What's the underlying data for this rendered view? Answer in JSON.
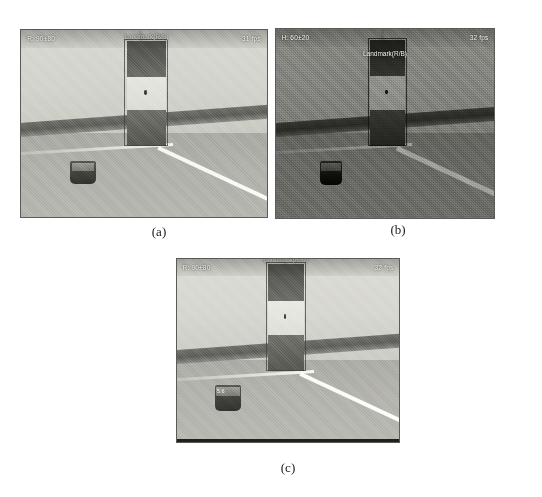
{
  "figure": {
    "panels": [
      {
        "id": "a",
        "caption": "(a)",
        "hud_left": "R: 90±80",
        "hud_right": "31 fps",
        "landmark_label": "Landmark(R/B)",
        "robot_tag": "",
        "style_note": "bright-grayscale"
      },
      {
        "id": "b",
        "caption": "(b)",
        "hud_left": "H: 60±20",
        "hud_right": "32 fps",
        "landmark_label": "Landmark(R/B)",
        "robot_tag": "",
        "style_note": "dark-noisy"
      },
      {
        "id": "c",
        "caption": "(c)",
        "hud_left": "R: 90±80",
        "hud_right": "32 fps",
        "landmark_label": "Landmark(R/B)",
        "robot_tag": "5.6",
        "style_note": "bright-grayscale"
      }
    ],
    "colors": {
      "wall": "#d5d5cf",
      "floor": "#b0b0aa",
      "baseboard": "#5c5c58",
      "landmark_dark": "#55554f",
      "landmark_light": "#e2e2dc",
      "hud_text": "#f4f4f0",
      "caption_text": "#1a1a18",
      "panel_border": "#5a5a56"
    }
  }
}
